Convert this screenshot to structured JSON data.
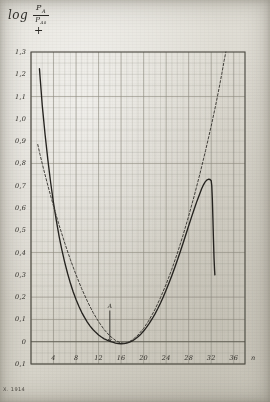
{
  "figure": {
    "title_prefix": "log",
    "fraction_numerator": "P",
    "fraction_numerator_sub": "A",
    "fraction_denominator": "P",
    "fraction_denominator_sub": "A0",
    "plus_sign": "+",
    "plate_caption": "X. 1914",
    "marker_label": "A",
    "paper_color": "#d8d6cf",
    "ink_color": "#2b2a26",
    "grid_color": "#8d8b80"
  },
  "chart_data": {
    "type": "line",
    "xlabel": "n",
    "ylabel": "log P_A/P_A0",
    "xlim": [
      0,
      38
    ],
    "ylim": [
      -0.1,
      1.3
    ],
    "grid": true,
    "grid_minor_step_x": 1,
    "grid_major_step_x": 4,
    "grid_minor_step_y": 0.05,
    "grid_major_step_y": 0.1,
    "legend": "none",
    "x_ticks": [
      4,
      8,
      12,
      16,
      20,
      24,
      28,
      32,
      36
    ],
    "x_tick_labels": [
      "4",
      "8",
      "12",
      "16",
      "20",
      "24",
      "28",
      "32",
      "36"
    ],
    "y_ticks": [
      -0.1,
      0,
      0.1,
      0.2,
      0.3,
      0.4,
      0.5,
      0.6,
      0.7,
      0.8,
      0.9,
      1.0,
      1.1,
      1.2,
      1.3
    ],
    "y_tick_labels": [
      "0,1",
      "0",
      "0,1",
      "0,2",
      "0,3",
      "0,4",
      "0,5",
      "0,6",
      "0,7",
      "0,8",
      "0,9",
      "1,0",
      "1,1",
      "1,2",
      "1,3"
    ],
    "annotations": [
      {
        "text": "A",
        "x": 14,
        "y": 0.14,
        "type": "arrow-down",
        "arrow_to_y": 0.0
      }
    ],
    "series": [
      {
        "name": "solid-curve",
        "style": "solid",
        "color": "#25231f",
        "points": [
          [
            1.5,
            1.225
          ],
          [
            2.0,
            1.06
          ],
          [
            2.5,
            0.93
          ],
          [
            3.0,
            0.815
          ],
          [
            3.5,
            0.712
          ],
          [
            4.0,
            0.622
          ],
          [
            4.5,
            0.543
          ],
          [
            5.0,
            0.472
          ],
          [
            5.5,
            0.41
          ],
          [
            6.0,
            0.355
          ],
          [
            6.5,
            0.306
          ],
          [
            7.0,
            0.262
          ],
          [
            7.5,
            0.223
          ],
          [
            8.0,
            0.189
          ],
          [
            8.5,
            0.159
          ],
          [
            9.0,
            0.132
          ],
          [
            9.5,
            0.109
          ],
          [
            10.0,
            0.088
          ],
          [
            10.5,
            0.07
          ],
          [
            11.0,
            0.055
          ],
          [
            11.5,
            0.042
          ],
          [
            12.0,
            0.03
          ],
          [
            12.5,
            0.021
          ],
          [
            13.0,
            0.013
          ],
          [
            13.5,
            0.007
          ],
          [
            14.0,
            0.002
          ],
          [
            14.5,
            -0.002
          ],
          [
            15.0,
            -0.006
          ],
          [
            15.5,
            -0.008
          ],
          [
            16.0,
            -0.009
          ],
          [
            16.5,
            -0.008
          ],
          [
            17.0,
            -0.006
          ],
          [
            17.5,
            -0.002
          ],
          [
            18.0,
            0.004
          ],
          [
            18.5,
            0.012
          ],
          [
            19.0,
            0.022
          ],
          [
            19.5,
            0.034
          ],
          [
            20.0,
            0.048
          ],
          [
            20.5,
            0.064
          ],
          [
            21.0,
            0.082
          ],
          [
            21.5,
            0.102
          ],
          [
            22.0,
            0.124
          ],
          [
            22.5,
            0.148
          ],
          [
            23.0,
            0.174
          ],
          [
            23.5,
            0.202
          ],
          [
            24.0,
            0.232
          ],
          [
            24.5,
            0.263
          ],
          [
            25.0,
            0.296
          ],
          [
            25.5,
            0.331
          ],
          [
            26.0,
            0.367
          ],
          [
            26.5,
            0.404
          ],
          [
            27.0,
            0.442
          ],
          [
            27.5,
            0.481
          ],
          [
            28.0,
            0.52
          ],
          [
            28.5,
            0.559
          ],
          [
            29.0,
            0.597
          ],
          [
            29.5,
            0.633
          ],
          [
            30.0,
            0.666
          ],
          [
            30.3,
            0.686
          ],
          [
            30.6,
            0.703
          ],
          [
            30.9,
            0.716
          ],
          [
            31.2,
            0.725
          ],
          [
            31.5,
            0.729
          ],
          [
            31.8,
            0.728
          ],
          [
            32.0,
            0.722
          ],
          [
            32.1,
            0.7
          ],
          [
            32.2,
            0.64
          ],
          [
            32.3,
            0.555
          ],
          [
            32.4,
            0.46
          ],
          [
            32.5,
            0.375
          ],
          [
            32.6,
            0.32
          ],
          [
            32.65,
            0.3
          ]
        ]
      },
      {
        "name": "dashed-curve",
        "style": "dashed",
        "color": "#3a3833",
        "points": [
          [
            1.2,
            0.885
          ],
          [
            1.6,
            0.84
          ],
          [
            2.2,
            0.778
          ],
          [
            3.0,
            0.7
          ],
          [
            4.0,
            0.608
          ],
          [
            5.0,
            0.522
          ],
          [
            6.0,
            0.442
          ],
          [
            7.0,
            0.368
          ],
          [
            8.0,
            0.3
          ],
          [
            9.0,
            0.238
          ],
          [
            10.0,
            0.182
          ],
          [
            11.0,
            0.132
          ],
          [
            12.0,
            0.09
          ],
          [
            13.0,
            0.054
          ],
          [
            14.0,
            0.026
          ],
          [
            15.0,
            0.006
          ],
          [
            15.8,
            -0.004
          ],
          [
            16.5,
            -0.007
          ],
          [
            17.2,
            -0.003
          ],
          [
            18.0,
            0.008
          ],
          [
            19.0,
            0.03
          ],
          [
            20.0,
            0.06
          ],
          [
            21.0,
            0.098
          ],
          [
            22.0,
            0.144
          ],
          [
            23.0,
            0.198
          ],
          [
            24.0,
            0.258
          ],
          [
            25.0,
            0.325
          ],
          [
            26.0,
            0.398
          ],
          [
            27.0,
            0.478
          ],
          [
            28.0,
            0.564
          ],
          [
            29.0,
            0.656
          ],
          [
            30.0,
            0.754
          ],
          [
            31.0,
            0.858
          ],
          [
            32.0,
            0.968
          ],
          [
            32.8,
            1.062
          ],
          [
            33.4,
            1.138
          ],
          [
            33.9,
            1.205
          ],
          [
            34.3,
            1.262
          ],
          [
            34.6,
            1.3
          ]
        ]
      }
    ]
  }
}
